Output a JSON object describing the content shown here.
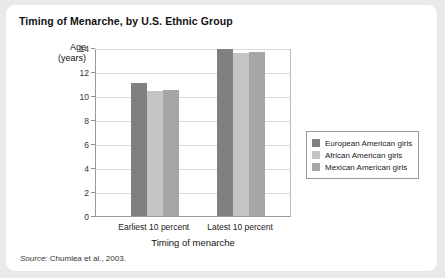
{
  "figure": {
    "title": "Timing of Menarche, by U.S. Ethnic Group",
    "source_word": "Source:",
    "source_text": " Chumlea et al., 2003."
  },
  "chart_data": {
    "type": "bar",
    "title": "Timing of Menarche, by U.S. Ethnic Group",
    "xlabel": "Timing of menarche",
    "ylabel": "Age (years)",
    "ylabel_line1": "Age",
    "ylabel_line2": "(years)",
    "categories": [
      "Earliest 10 percent",
      "Latest 10 percent"
    ],
    "series": [
      {
        "name": "European American girls",
        "color": "#808080",
        "values": [
          11.1,
          13.9
        ]
      },
      {
        "name": "African American girls",
        "color": "#c4c4c4",
        "values": [
          10.4,
          13.6
        ]
      },
      {
        "name": "Mexican American girls",
        "color": "#a6a6a6",
        "values": [
          10.5,
          13.7
        ]
      }
    ],
    "ylim": [
      0,
      14
    ],
    "yticks": [
      0,
      2,
      4,
      6,
      8,
      10,
      12,
      14
    ],
    "ytick_labels": [
      "0",
      "2",
      "4",
      "6",
      "8",
      "10",
      "12",
      "14"
    ],
    "grid": true,
    "legend_position": "right"
  }
}
